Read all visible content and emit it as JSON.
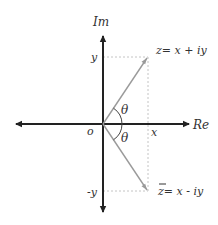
{
  "diagram": {
    "axes": {
      "real_label": "Re",
      "imag_label": "Im",
      "origin_label": "o"
    },
    "ticks": {
      "x_label": "x",
      "y_label": "y",
      "neg_y_label": "-y"
    },
    "angles": {
      "upper": "θ",
      "lower": "θ"
    },
    "points": {
      "z": {
        "label": "z= x + iy"
      },
      "z_conjugate": {
        "label": "z= x - iy",
        "bar": "‾"
      }
    },
    "colors": {
      "axis": "#222222",
      "vector": "#9a9a9a",
      "dashed": "#bdbdbd",
      "text": "#333333",
      "background": "#ffffff"
    }
  }
}
